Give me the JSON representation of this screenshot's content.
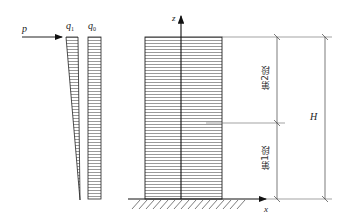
{
  "labels": {
    "load_p": "p",
    "q1": "q",
    "q1_sub": "1",
    "q0": "q",
    "q0_sub": "0",
    "axis_z": "z",
    "axis_x": "x",
    "height": "H",
    "segment_2": "第2段",
    "segment_1": "第1段"
  },
  "colors": {
    "line": "#222222",
    "hatch": "#444444",
    "background": "#ffffff"
  }
}
